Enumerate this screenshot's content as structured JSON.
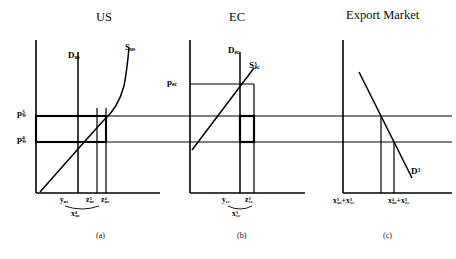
{
  "figure": {
    "type": "economics-supply-demand-three-panel",
    "background": "#ffffff",
    "line_color": "#000000"
  },
  "panels": [
    {
      "id": "a",
      "title": "US",
      "caption": "(a)",
      "curves": {
        "demand_label": "D",
        "demand_sub": "us",
        "supply_label": "S",
        "supply_sub": "us",
        "supply_sup": ""
      },
      "price_axis_labels": [
        {
          "text": "p",
          "sub": "w",
          "sup": "3"
        },
        {
          "text": "p",
          "sub": "w",
          "sup": "4"
        }
      ],
      "quantity_labels": [
        {
          "text": "y",
          "sub": "us",
          "sup": ""
        },
        {
          "text": "z",
          "sub": "us",
          "sup": "3"
        },
        {
          "text": "z",
          "sub": "us",
          "sup": "4"
        }
      ],
      "brace_label": {
        "text": "x",
        "sub": "us",
        "sup": "4"
      }
    },
    {
      "id": "b",
      "title": "EC",
      "caption": "(b)",
      "curves": {
        "demand_label": "D",
        "demand_sub": "ec",
        "supply_label": "S",
        "supply_sub": "ec",
        "supply_sup": "3"
      },
      "price_axis_labels": [
        {
          "text": "p",
          "sub": "ec",
          "sup": ""
        }
      ],
      "quantity_labels": [
        {
          "text": "y",
          "sub": "ec",
          "sup": ""
        },
        {
          "text": "z",
          "sub": "ec",
          "sup": "3"
        }
      ],
      "brace_label": {
        "text": "x",
        "sub": "ec",
        "sup": "3"
      }
    },
    {
      "id": "c",
      "title": "Export Market",
      "caption": "(c)",
      "curves": {
        "demand_label": "D",
        "demand_sub": "",
        "demand_sup": "3"
      },
      "price_axis_labels": [],
      "quantity_labels": [
        {
          "parts": [
            {
              "text": "x",
              "sub": "us",
              "sup": "3"
            },
            {
              "text": "+",
              "sub": "",
              "sup": ""
            },
            {
              "text": "x",
              "sub": "ec",
              "sup": "3"
            }
          ]
        },
        {
          "parts": [
            {
              "text": "x",
              "sub": "us",
              "sup": "4"
            },
            {
              "text": "+",
              "sub": "",
              "sup": ""
            },
            {
              "text": "x",
              "sub": "ec",
              "sup": "3"
            }
          ]
        }
      ]
    }
  ],
  "shared": {
    "world_price_high": {
      "text": "p",
      "sub": "w",
      "sup": "3"
    },
    "world_price_low": {
      "text": "p",
      "sub": "w",
      "sup": "4"
    }
  }
}
